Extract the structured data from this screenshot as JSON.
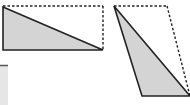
{
  "diagram": {
    "colors": {
      "fill": "#d4d4d4",
      "stroke": "#222222",
      "dashed": "#222222",
      "partial_box": "#e6e6e6"
    },
    "figures": [
      {
        "name": "rectangle-with-right-triangle",
        "outline": "rectangle",
        "triangle_points": [
          [
            3,
            7
          ],
          [
            3,
            50
          ],
          [
            103,
            50
          ]
        ],
        "dashed_edges": [
          [
            [
              3,
              6
            ],
            [
              103,
              6
            ]
          ],
          [
            [
              103,
              6
            ],
            [
              103,
              50
            ]
          ]
        ]
      },
      {
        "name": "parallelogram-with-triangle",
        "outline": "parallelogram",
        "triangle_points": [
          [
            114,
            6
          ],
          [
            142,
            96
          ],
          [
            190,
            96
          ]
        ],
        "dashed_edges": [
          [
            [
              114,
              6
            ],
            [
              167,
              6
            ]
          ],
          [
            [
              167,
              6
            ],
            [
              190,
              96
            ]
          ]
        ]
      }
    ]
  }
}
